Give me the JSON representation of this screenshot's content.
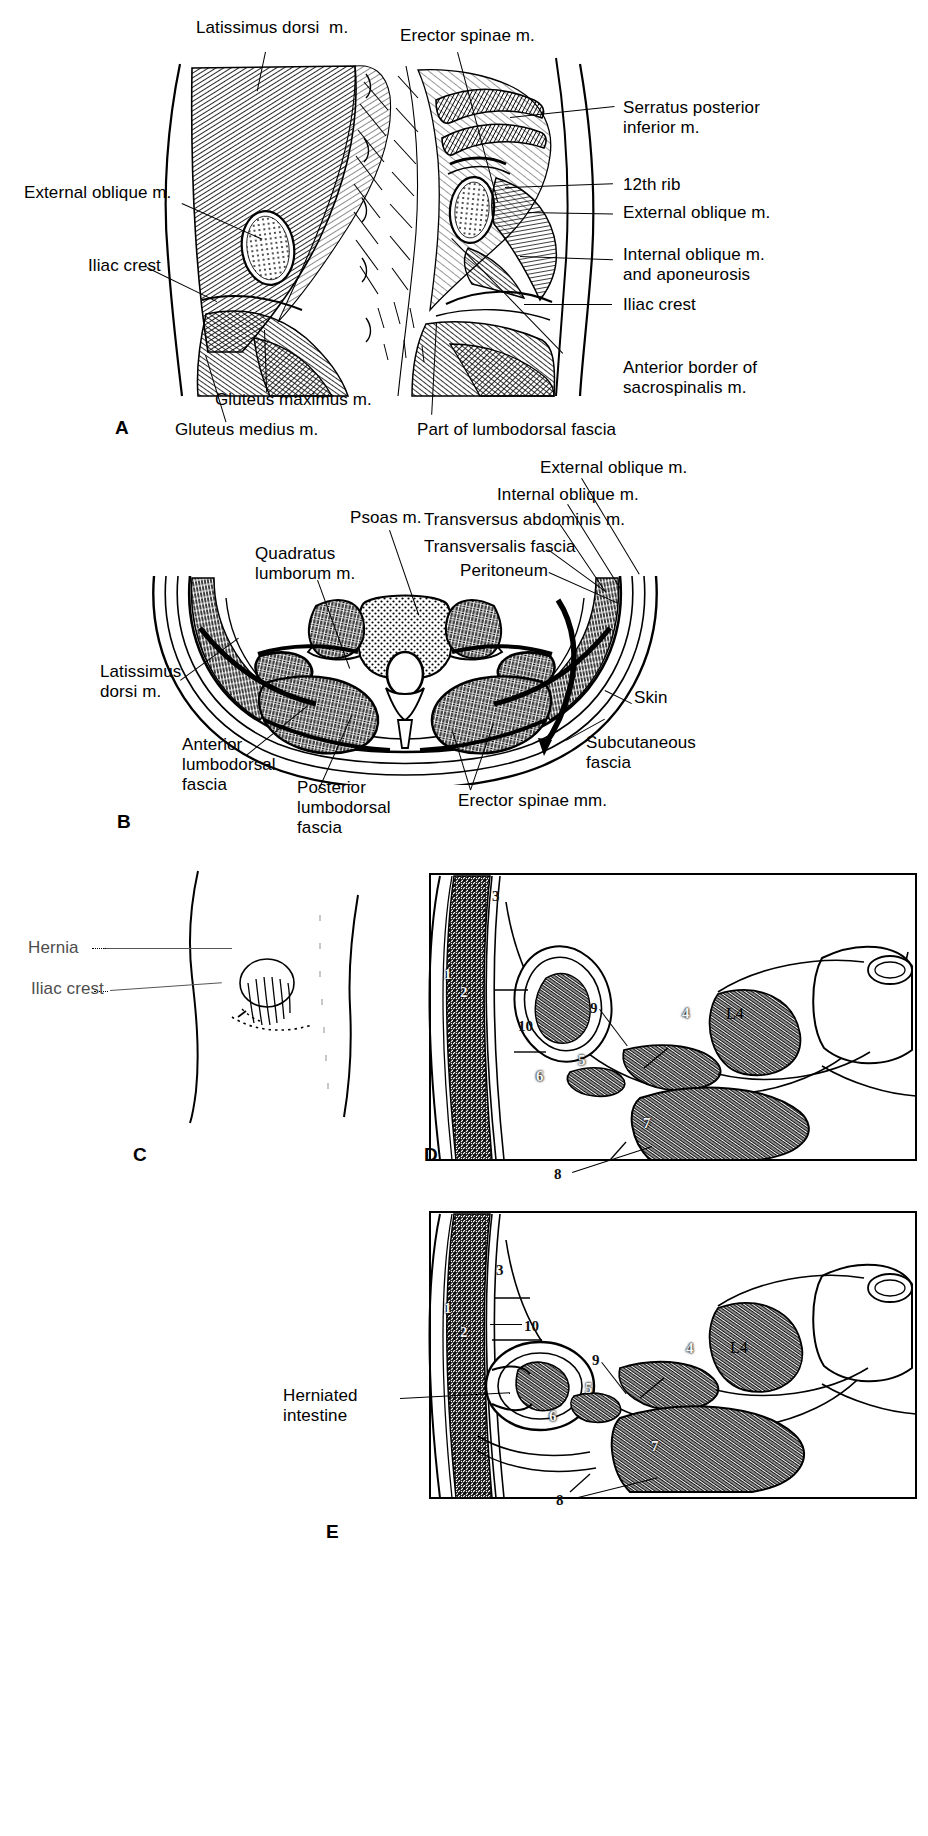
{
  "figure": {
    "ink_color": "#000000",
    "paper_color": "#ffffff"
  },
  "panels": [
    {
      "id": "A",
      "letter": "A",
      "caption": "Posterior view of lumbar region musculature",
      "labels_top": [
        {
          "key": "latissimus_dorsi",
          "text": "Latissimus dorsi  m."
        },
        {
          "key": "erector_spinae",
          "text": "Erector spinae m."
        }
      ],
      "labels_left": [
        {
          "key": "external_oblique_left",
          "text": "External oblique m."
        },
        {
          "key": "iliac_crest_left",
          "text": "Iliac crest"
        }
      ],
      "labels_right": [
        {
          "key": "serratus_posterior_inferior",
          "text": "Serratus posterior\ninferior m."
        },
        {
          "key": "twelfth_rib",
          "text": "12th rib"
        },
        {
          "key": "external_oblique_right",
          "text": "External oblique m."
        },
        {
          "key": "internal_oblique",
          "text": "Internal oblique m.\nand aponeurosis"
        },
        {
          "key": "iliac_crest_right",
          "text": "Iliac crest"
        },
        {
          "key": "anterior_border_sacrospinalis",
          "text": "Anterior border of\nsacrospinalis m."
        }
      ],
      "labels_bottom": [
        {
          "key": "gluteus_maximus",
          "text": "Gluteus maximus m."
        },
        {
          "key": "gluteus_medius",
          "text": "Gluteus medius m."
        },
        {
          "key": "lumbodorsal_fascia",
          "text": "Part of lumbodorsal fascia"
        }
      ]
    },
    {
      "id": "B",
      "letter": "B",
      "caption": "Cross section of the lumbar region",
      "labels": [
        {
          "key": "external_oblique",
          "text": "External oblique m."
        },
        {
          "key": "internal_oblique",
          "text": "Internal oblique m."
        },
        {
          "key": "psoas",
          "text": "Psoas m."
        },
        {
          "key": "transversus_abdominis",
          "text": "Transversus abdominis m."
        },
        {
          "key": "transversalis_fascia",
          "text": "Transversalis fascia"
        },
        {
          "key": "peritoneum",
          "text": "Peritoneum"
        },
        {
          "key": "quadratus_lumborum",
          "text": "Quadratus\nlumborum m."
        },
        {
          "key": "latissimus_dorsi",
          "text": "Latissimus\ndorsi m."
        },
        {
          "key": "skin",
          "text": "Skin"
        },
        {
          "key": "subcutaneous_fascia",
          "text": "Subcutaneous\nfascia"
        },
        {
          "key": "anterior_lumbodorsal_fascia",
          "text": "Anterior\nlumbodorsal\nfascia"
        },
        {
          "key": "posterior_lumbodorsal_fascia",
          "text": "Posterior\nlumbodorsal\nfascia"
        },
        {
          "key": "erector_spinae",
          "text": "Erector spinae mm."
        }
      ]
    },
    {
      "id": "C",
      "letter": "C",
      "caption": "Surface appearance of a lumbar hernia",
      "labels": [
        {
          "key": "hernia",
          "text": "Hernia"
        },
        {
          "key": "iliac_crest",
          "text": "Iliac crest"
        }
      ]
    },
    {
      "id": "D",
      "letter": "D",
      "caption": "Transverse section at L4 — normal",
      "vertebra_label": "L4",
      "numbers": [
        "1",
        "2",
        "3",
        "4",
        "5",
        "6",
        "7",
        "8",
        "9",
        "10"
      ]
    },
    {
      "id": "E",
      "letter": "E",
      "caption": "Transverse section at L4 — herniated intestine",
      "vertebra_label": "L4",
      "numbers": [
        "1",
        "2",
        "3",
        "4",
        "5",
        "6",
        "7",
        "8",
        "9",
        "10"
      ],
      "labels": [
        {
          "key": "herniated_intestine",
          "text": "Herniated\nintestine"
        }
      ]
    }
  ]
}
